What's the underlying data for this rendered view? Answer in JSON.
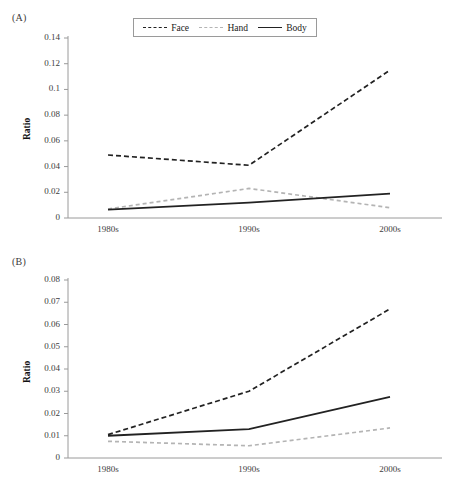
{
  "figure": {
    "background": "#ffffff",
    "axis_color": "#9a9a9a",
    "text_color": "#1a1a1a"
  },
  "legend": {
    "position": "top-center",
    "entries": [
      {
        "label": "Face",
        "style": "dashed",
        "color": "#222222",
        "swatch": "dashed-dark-line-swatch"
      },
      {
        "label": "Hand",
        "style": "dashed",
        "color": "#b4b4b4",
        "swatch": "dashed-gray-line-swatch"
      },
      {
        "label": "Body",
        "style": "solid",
        "color": "#222222",
        "swatch": "solid-dark-line-swatch"
      }
    ]
  },
  "panels": {
    "a": {
      "label": "(A)"
    },
    "b": {
      "label": "(B)"
    }
  },
  "chart_data": [
    {
      "id": "panel-a",
      "panel_label": "(A)",
      "type": "line",
      "title": "",
      "xlabel": "",
      "ylabel": "Ratio",
      "categories": [
        "1980s",
        "1990s",
        "2000s"
      ],
      "ylim": [
        0,
        0.14
      ],
      "yticks": [
        0,
        0.02,
        0.04,
        0.06,
        0.08,
        0.1,
        0.12,
        0.14
      ],
      "ytick_labels": [
        "0",
        "0.02",
        "0.04",
        "0.06",
        "0.08",
        "0.1",
        "0.12",
        "0.14"
      ],
      "grid": false,
      "legend_position": "top-center",
      "series": [
        {
          "name": "Face",
          "style": "dashed",
          "color": "#222222",
          "values": [
            0.049,
            0.041,
            0.115
          ]
        },
        {
          "name": "Hand",
          "style": "dashed",
          "color": "#b4b4b4",
          "values": [
            0.007,
            0.023,
            0.008
          ]
        },
        {
          "name": "Body",
          "style": "solid",
          "color": "#222222",
          "values": [
            0.0065,
            0.012,
            0.019
          ]
        }
      ]
    },
    {
      "id": "panel-b",
      "panel_label": "(B)",
      "type": "line",
      "title": "",
      "xlabel": "",
      "ylabel": "Ratio",
      "categories": [
        "1980s",
        "1990s",
        "2000s"
      ],
      "ylim": [
        0,
        0.08
      ],
      "yticks": [
        0,
        0.01,
        0.02,
        0.03,
        0.04,
        0.05,
        0.06,
        0.07,
        0.08
      ],
      "ytick_labels": [
        "0",
        "0.01",
        "0.02",
        "0.03",
        "0.04",
        "0.05",
        "0.06",
        "0.07",
        "0.08"
      ],
      "grid": false,
      "legend_position": "none",
      "series": [
        {
          "name": "Face",
          "style": "dashed",
          "color": "#222222",
          "values": [
            0.0105,
            0.03,
            0.067
          ]
        },
        {
          "name": "Hand",
          "style": "dashed",
          "color": "#b4b4b4",
          "values": [
            0.0075,
            0.0055,
            0.0135
          ]
        },
        {
          "name": "Body",
          "style": "solid",
          "color": "#222222",
          "values": [
            0.01,
            0.013,
            0.0275
          ]
        }
      ]
    }
  ]
}
